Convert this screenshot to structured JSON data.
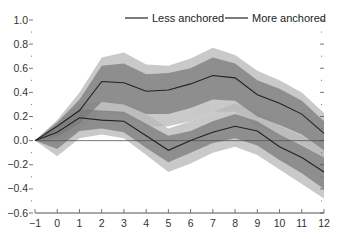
{
  "chart_data": {
    "type": "line",
    "title": "",
    "xlabel": "",
    "ylabel": "",
    "xlim": [
      -1,
      12
    ],
    "ylim": [
      -0.6,
      1.0
    ],
    "grid": false,
    "legend_position": "top-center",
    "x": [
      -1,
      0,
      1,
      2,
      3,
      4,
      5,
      6,
      7,
      8,
      9,
      10,
      11,
      12
    ],
    "x_tick_labels": [
      "−1",
      "0",
      "1",
      "2",
      "3",
      "4",
      "5",
      "6",
      "7",
      "8",
      "9",
      "10",
      "11",
      "12"
    ],
    "y_ticks": [
      1.0,
      0.8,
      0.6,
      0.4,
      0.2,
      0.0,
      -0.2,
      -0.4,
      -0.6
    ],
    "y_tick_labels": [
      "1.0",
      "0.8",
      "0.6",
      "0.4",
      "0.2",
      "0.0",
      "−0.2",
      "−0.4",
      "−0.6"
    ],
    "zero_line": true,
    "series": [
      {
        "name": "Less anchored",
        "values": [
          0.0,
          0.12,
          0.25,
          0.49,
          0.48,
          0.41,
          0.42,
          0.47,
          0.54,
          0.52,
          0.38,
          0.31,
          0.22,
          0.06
        ],
        "inner_band_lower": [
          0.0,
          0.03,
          0.14,
          0.32,
          0.3,
          0.22,
          0.22,
          0.27,
          0.34,
          0.33,
          0.2,
          0.13,
          0.05,
          -0.08
        ],
        "inner_band_upper": [
          0.0,
          0.15,
          0.34,
          0.62,
          0.64,
          0.55,
          0.56,
          0.6,
          0.69,
          0.64,
          0.5,
          0.43,
          0.33,
          0.16
        ],
        "outer_band_lower": [
          0.0,
          -0.02,
          0.09,
          0.24,
          0.22,
          0.12,
          0.12,
          0.16,
          0.24,
          0.24,
          0.12,
          0.05,
          -0.03,
          -0.14
        ],
        "outer_band_upper": [
          0.0,
          0.17,
          0.4,
          0.69,
          0.73,
          0.63,
          0.62,
          0.68,
          0.77,
          0.71,
          0.58,
          0.5,
          0.4,
          0.23
        ]
      },
      {
        "name": "More anchored",
        "values": [
          0.0,
          0.07,
          0.19,
          0.17,
          0.16,
          0.04,
          -0.08,
          0.0,
          0.07,
          0.12,
          0.08,
          -0.05,
          -0.14,
          -0.26
        ],
        "inner_band_lower": [
          0.0,
          -0.07,
          0.08,
          0.1,
          0.07,
          -0.06,
          -0.18,
          -0.1,
          -0.02,
          0.02,
          -0.04,
          -0.16,
          -0.27,
          -0.4
        ],
        "inner_band_upper": [
          0.0,
          0.12,
          0.26,
          0.25,
          0.24,
          0.14,
          0.04,
          0.08,
          0.16,
          0.22,
          0.16,
          0.05,
          -0.04,
          -0.14
        ],
        "outer_band_lower": [
          0.0,
          -0.13,
          0.02,
          0.05,
          0.02,
          -0.12,
          -0.26,
          -0.19,
          -0.1,
          -0.05,
          -0.12,
          -0.24,
          -0.36,
          -0.48
        ],
        "outer_band_upper": [
          0.0,
          0.16,
          0.3,
          0.32,
          0.31,
          0.22,
          0.1,
          0.16,
          0.24,
          0.31,
          0.24,
          0.12,
          0.04,
          -0.06
        ]
      }
    ]
  },
  "legend": {
    "items": [
      {
        "label": "Less anchored"
      },
      {
        "label": "More anchored"
      }
    ]
  },
  "colors": {
    "outer_band": "#b7b7b7",
    "inner_band": "#7a7a7a",
    "line": "#222222",
    "zero_line": "#555555",
    "axis": "#555555"
  }
}
